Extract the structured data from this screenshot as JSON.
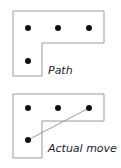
{
  "diagrams": [
    {
      "label": "Path",
      "dots": [
        [
          28,
          28
        ],
        [
          58,
          28
        ],
        [
          89,
          28
        ],
        [
          28,
          61
        ]
      ],
      "outline": "13,11 104,11 104,43 42,43 42,76 13,76"
    },
    {
      "label": "Actual move",
      "dots": [
        [
          28,
          108
        ],
        [
          58,
          108
        ],
        [
          89,
          108
        ],
        [
          28,
          140
        ]
      ],
      "outline": "13,94 104,94 104,121 42,121 42,158 13,158",
      "move_line": [
        [
          28,
          140
        ],
        [
          89,
          108
        ]
      ]
    }
  ],
  "colors": {
    "outline": "#9a9a9a",
    "dot": "#111111",
    "move": "#9a9a9a"
  }
}
